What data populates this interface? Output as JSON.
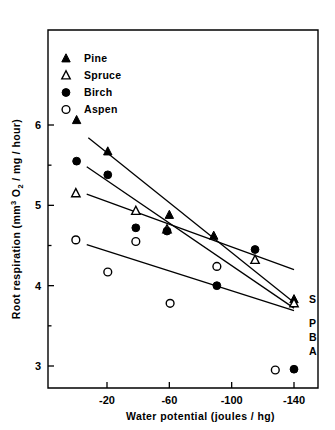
{
  "figure": {
    "background_color": "#ffffff",
    "foreground_color": "#000000"
  },
  "axes": {
    "x_title": "Water potential (joules / hg)",
    "y_title_prefix": "Root respiration (mm",
    "y_title_sup": "3",
    "y_title_mid": " O",
    "y_title_sub": "2",
    "y_title_suffix": " / mg / hour)",
    "x_ticklabels": [
      "-20",
      "-60",
      "-100",
      "-140"
    ],
    "y_ticklabels": [
      "6",
      "5",
      "4",
      "3"
    ]
  },
  "legend": {
    "items": [
      {
        "label": "Pine",
        "marker": "filled-triangle"
      },
      {
        "label": "Spruce",
        "marker": "open-triangle"
      },
      {
        "label": "Birch",
        "marker": "filled-circle"
      },
      {
        "label": "Aspen",
        "marker": "open-circle"
      }
    ]
  },
  "end_labels": [
    {
      "text": "S",
      "series": "Spruce"
    },
    {
      "text": "P",
      "series": "Pine"
    },
    {
      "text": "B",
      "series": "Birch"
    },
    {
      "text": "A",
      "series": "Aspen"
    }
  ],
  "chart_data": {
    "type": "scatter",
    "title": "",
    "xlabel": "Water potential (joules / hg)",
    "ylabel": "Root respiration (mm3 O2 / mg / hour)",
    "xlim": [
      -7,
      -152
    ],
    "ylim": [
      2.72,
      6.55
    ],
    "xticks": [
      -20,
      -60,
      -100,
      -140
    ],
    "yticks": [
      6,
      5,
      4,
      3
    ],
    "grid": false,
    "legend_position": "top-left",
    "series": [
      {
        "name": "Pine",
        "marker": "filled-triangle",
        "points": [
          {
            "x": -0.5,
            "y": 6.06
          },
          {
            "x": -20.5,
            "y": 5.67
          },
          {
            "x": -60.0,
            "y": 4.88
          },
          {
            "x": -88.5,
            "y": 4.62
          },
          {
            "x": -140.0,
            "y": 3.83
          }
        ],
        "fit_line": {
          "x1": -8.0,
          "y1": 5.84,
          "x2": -140.0,
          "y2": 3.79
        }
      },
      {
        "name": "Spruce",
        "marker": "open-triangle",
        "points": [
          {
            "x": 0.0,
            "y": 5.15
          },
          {
            "x": -38.5,
            "y": 4.93
          },
          {
            "x": -58.5,
            "y": 4.7
          },
          {
            "x": -115.0,
            "y": 4.32
          },
          {
            "x": -140.0,
            "y": 3.78
          }
        ],
        "fit_line": {
          "x1": -7.0,
          "y1": 5.14,
          "x2": -140.0,
          "y2": 4.2
        }
      },
      {
        "name": "Birch",
        "marker": "filled-circle",
        "points": [
          {
            "x": -0.5,
            "y": 5.55
          },
          {
            "x": -20.5,
            "y": 5.38
          },
          {
            "x": -38.5,
            "y": 4.72
          },
          {
            "x": -58.5,
            "y": 4.68
          },
          {
            "x": -90.5,
            "y": 4.0
          },
          {
            "x": -115.0,
            "y": 4.45
          },
          {
            "x": -140.0,
            "y": 2.96
          }
        ],
        "fit_line": {
          "x1": -7.0,
          "y1": 5.48,
          "x2": -140.0,
          "y2": 3.72
        }
      },
      {
        "name": "Aspen",
        "marker": "open-circle",
        "points": [
          {
            "x": 0.0,
            "y": 4.57
          },
          {
            "x": -20.5,
            "y": 4.17
          },
          {
            "x": -38.5,
            "y": 4.55
          },
          {
            "x": -60.5,
            "y": 3.78
          },
          {
            "x": -90.5,
            "y": 4.24
          },
          {
            "x": -128.0,
            "y": 2.95
          }
        ],
        "fit_line": {
          "x1": -7.0,
          "y1": 4.51,
          "x2": -140.0,
          "y2": 3.69
        }
      }
    ]
  }
}
